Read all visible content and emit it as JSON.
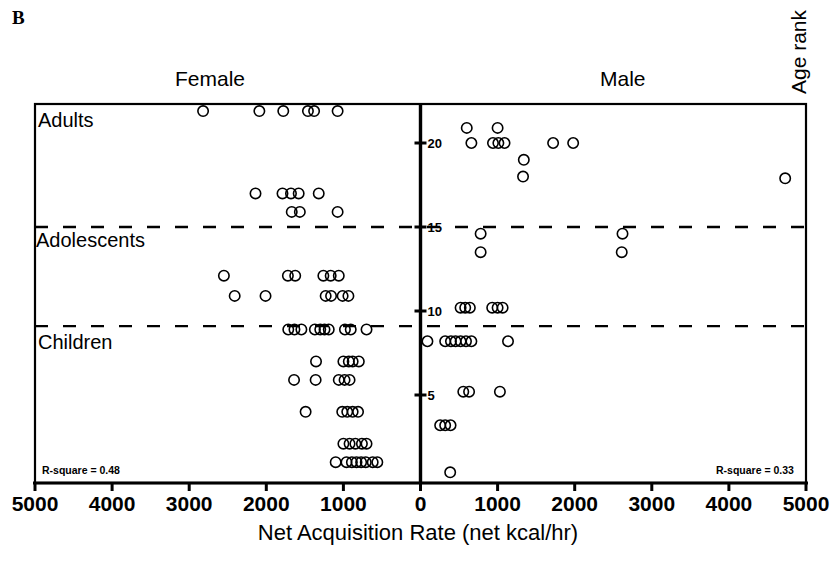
{
  "panel": {
    "letter": "B"
  },
  "labels": {
    "female": "Female",
    "male": "Male",
    "y_axis_title": "Age rank",
    "x_axis_title": "Net Acquisition Rate (net kcal/hr)",
    "group_adults": "Adults",
    "group_adolescents": "Adolescents",
    "group_children": "Children",
    "rsquare_female": "R-square = 0.48",
    "rsquare_male": "R-square = 0.33"
  },
  "chart_data": {
    "type": "scatter",
    "title": "B",
    "xlabel": "Net Acquisition Rate (net kcal/hr)",
    "ylabel": "Age rank",
    "xlim": [
      -5000,
      5000
    ],
    "ylim": [
      0,
      22
    ],
    "grid": false,
    "legend_position": "none",
    "x_tick_labels": [
      "5000",
      "4000",
      "3000",
      "2000",
      "1000",
      "0",
      "1000",
      "2000",
      "3000",
      "4000",
      "5000"
    ],
    "x_tick_values": [
      -5000,
      -4000,
      -3000,
      -2000,
      -1000,
      0,
      1000,
      2000,
      3000,
      4000,
      5000
    ],
    "y_tick_labels": [
      "20",
      "15",
      "10",
      "5"
    ],
    "y_tick_values": [
      20,
      15,
      10,
      5
    ],
    "x_axis_note": "Left half = Female (values increase leftward), right half = Male",
    "reference_lines": [
      {
        "name": "adolescents-boundary",
        "y": 15,
        "style": "dashed"
      },
      {
        "name": "children-boundary",
        "y": 9.1,
        "style": "dashed"
      }
    ],
    "annotations": [
      {
        "text": "Adults",
        "y": 21.2,
        "side": "left"
      },
      {
        "text": "Adolescents",
        "y": 14.2,
        "side": "left"
      },
      {
        "text": "Children",
        "y": 8.1,
        "side": "left"
      },
      {
        "text": "R-square = 0.48",
        "side": "left-bottom"
      },
      {
        "text": "R-square = 0.33",
        "side": "right-bottom"
      }
    ],
    "series": [
      {
        "name": "Female",
        "marker": "open-circle",
        "points": [
          {
            "x": -2820,
            "y": 21.9
          },
          {
            "x": -2090,
            "y": 21.9
          },
          {
            "x": -1780,
            "y": 21.9
          },
          {
            "x": -1460,
            "y": 21.9
          },
          {
            "x": -1380,
            "y": 21.9
          },
          {
            "x": -1075,
            "y": 21.9
          },
          {
            "x": -2140,
            "y": 17.0
          },
          {
            "x": -1790,
            "y": 17.0
          },
          {
            "x": -1680,
            "y": 17.0
          },
          {
            "x": -1580,
            "y": 17.0
          },
          {
            "x": -1320,
            "y": 17.0
          },
          {
            "x": -1670,
            "y": 15.9
          },
          {
            "x": -1565,
            "y": 15.9
          },
          {
            "x": -1075,
            "y": 15.9
          },
          {
            "x": -2550,
            "y": 12.1
          },
          {
            "x": -1720,
            "y": 12.1
          },
          {
            "x": -1625,
            "y": 12.1
          },
          {
            "x": -1260,
            "y": 12.1
          },
          {
            "x": -1165,
            "y": 12.1
          },
          {
            "x": -1060,
            "y": 12.1
          },
          {
            "x": -2410,
            "y": 10.9
          },
          {
            "x": -2010,
            "y": 10.9
          },
          {
            "x": -1230,
            "y": 10.9
          },
          {
            "x": -1160,
            "y": 10.9
          },
          {
            "x": -1010,
            "y": 10.9
          },
          {
            "x": -935,
            "y": 10.9
          },
          {
            "x": -1715,
            "y": 8.9
          },
          {
            "x": -1635,
            "y": 8.9
          },
          {
            "x": -1545,
            "y": 8.9
          },
          {
            "x": -1370,
            "y": 8.9
          },
          {
            "x": -1300,
            "y": 8.9
          },
          {
            "x": -1245,
            "y": 8.9
          },
          {
            "x": -1190,
            "y": 8.9
          },
          {
            "x": -980,
            "y": 8.9
          },
          {
            "x": -905,
            "y": 8.9
          },
          {
            "x": -700,
            "y": 8.9
          },
          {
            "x": -1355,
            "y": 7.0
          },
          {
            "x": -1000,
            "y": 7.0
          },
          {
            "x": -930,
            "y": 7.0
          },
          {
            "x": -880,
            "y": 7.0
          },
          {
            "x": -800,
            "y": 7.0
          },
          {
            "x": -1640,
            "y": 5.9
          },
          {
            "x": -1360,
            "y": 5.9
          },
          {
            "x": -1060,
            "y": 5.9
          },
          {
            "x": -985,
            "y": 5.9
          },
          {
            "x": -920,
            "y": 5.9
          },
          {
            "x": -1490,
            "y": 4.0
          },
          {
            "x": -1015,
            "y": 4.0
          },
          {
            "x": -950,
            "y": 4.0
          },
          {
            "x": -880,
            "y": 4.0
          },
          {
            "x": -810,
            "y": 4.0
          },
          {
            "x": -1000,
            "y": 2.1
          },
          {
            "x": -920,
            "y": 2.1
          },
          {
            "x": -845,
            "y": 2.1
          },
          {
            "x": -760,
            "y": 2.1
          },
          {
            "x": -700,
            "y": 2.1
          },
          {
            "x": -1100,
            "y": 1.0
          },
          {
            "x": -960,
            "y": 1.0
          },
          {
            "x": -890,
            "y": 1.0
          },
          {
            "x": -830,
            "y": 1.0
          },
          {
            "x": -770,
            "y": 1.0
          },
          {
            "x": -710,
            "y": 1.0
          },
          {
            "x": -620,
            "y": 1.0
          },
          {
            "x": -560,
            "y": 1.0
          }
        ]
      },
      {
        "name": "Male",
        "marker": "open-circle",
        "points": [
          {
            "x": 600,
            "y": 20.9
          },
          {
            "x": 1000,
            "y": 20.9
          },
          {
            "x": 660,
            "y": 20.0
          },
          {
            "x": 940,
            "y": 20.0
          },
          {
            "x": 1010,
            "y": 20.0
          },
          {
            "x": 1090,
            "y": 20.0
          },
          {
            "x": 1720,
            "y": 20.0
          },
          {
            "x": 1980,
            "y": 20.0
          },
          {
            "x": 1340,
            "y": 19.0
          },
          {
            "x": 1330,
            "y": 18.0
          },
          {
            "x": 4730,
            "y": 17.9
          },
          {
            "x": 780,
            "y": 14.6
          },
          {
            "x": 2620,
            "y": 14.6
          },
          {
            "x": 780,
            "y": 13.5
          },
          {
            "x": 2610,
            "y": 13.5
          },
          {
            "x": 520,
            "y": 10.2
          },
          {
            "x": 580,
            "y": 10.2
          },
          {
            "x": 640,
            "y": 10.2
          },
          {
            "x": 930,
            "y": 10.2
          },
          {
            "x": 1000,
            "y": 10.2
          },
          {
            "x": 1065,
            "y": 10.2
          },
          {
            "x": 90,
            "y": 8.2
          },
          {
            "x": 320,
            "y": 8.2
          },
          {
            "x": 395,
            "y": 8.2
          },
          {
            "x": 455,
            "y": 8.2
          },
          {
            "x": 520,
            "y": 8.2
          },
          {
            "x": 590,
            "y": 8.2
          },
          {
            "x": 660,
            "y": 8.2
          },
          {
            "x": 1135,
            "y": 8.2
          },
          {
            "x": 555,
            "y": 5.2
          },
          {
            "x": 630,
            "y": 5.2
          },
          {
            "x": 1030,
            "y": 5.2
          },
          {
            "x": 255,
            "y": 3.2
          },
          {
            "x": 320,
            "y": 3.2
          },
          {
            "x": 390,
            "y": 3.2
          },
          {
            "x": 385,
            "y": 0.4
          }
        ]
      }
    ]
  }
}
